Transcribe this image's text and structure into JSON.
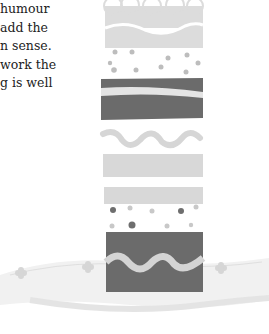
{
  "document": {
    "text_lines": [
      "humour",
      "add the",
      "n sense.",
      "work the",
      "g is well"
    ]
  },
  "illustration": {
    "subject": "layered-cake",
    "colors": {
      "light": "#d8d8d8",
      "dark": "#6b6b6b",
      "dot": "#9a9a9a",
      "plate": "#e8e8e8"
    }
  }
}
